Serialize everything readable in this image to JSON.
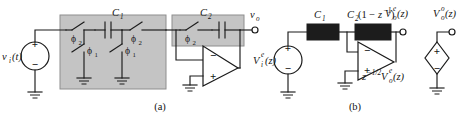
{
  "figure": {
    "background_color": "#ffffff",
    "wire_color": "#1a1a1a",
    "shade_color": "#c4c4c4",
    "cap_block_color": "#1c1c1c"
  },
  "captions": {
    "a": "(a)",
    "b": "(b)"
  },
  "panel_a": {
    "source": {
      "name": "input-source",
      "label_main": "v",
      "label_sub": "i",
      "label_tail": "(t)",
      "plus": "+",
      "minus": "−"
    },
    "switches": [
      {
        "id": "sw-series-1",
        "phase": "ϕ",
        "phase_sub": "2"
      },
      {
        "id": "sw-shunt-1",
        "phase": "ϕ",
        "phase_sub": "1"
      },
      {
        "id": "sw-shunt-2",
        "phase": "ϕ",
        "phase_sub": "1"
      },
      {
        "id": "sw-series-2",
        "phase": "ϕ",
        "phase_sub": "2"
      },
      {
        "id": "sw-series-3",
        "phase": "ϕ",
        "phase_sub": "2"
      }
    ],
    "capacitors": [
      {
        "id": "cap-c1",
        "label": "C",
        "label_sub": "1"
      },
      {
        "id": "cap-c2",
        "label": "C",
        "label_sub": "2"
      }
    ],
    "opamp": {
      "minus": "−",
      "plus": "+"
    },
    "output": {
      "label_main": "v",
      "label_sub": "o"
    }
  },
  "panel_b": {
    "source": {
      "name": "input-source-z",
      "label_main": "V",
      "label_sub": "i",
      "label_sup": "e",
      "label_tail": "(z)",
      "plus": "+",
      "minus": "−"
    },
    "impedances": [
      {
        "id": "block-c1",
        "label": "C",
        "label_sub": "1",
        "label_tail": ""
      },
      {
        "id": "block-c2",
        "label": "C",
        "label_sub": "2",
        "label_tail": "(1 − z−1)"
      }
    ],
    "c2_expression": {
      "base": "C",
      "sub": "2",
      "open": "(1 − ",
      "z": "z",
      "exp": "−1",
      "close": ")"
    },
    "opamp": {
      "minus": "−",
      "plus": "+"
    },
    "opamp_output_label": {
      "prefix": "z",
      "exp": "−1/2",
      "v": "V",
      "sub": "o",
      "sup": "e",
      "tail": "(z)"
    },
    "outputs": [
      {
        "id": "node-vo-even",
        "label_main": "V",
        "label_sub": "o",
        "label_sup": "e",
        "label_tail": "(z)"
      },
      {
        "id": "node-vo-odd",
        "label_main": "V",
        "label_sub": "o",
        "label_sup": "o",
        "label_tail": "(z)"
      }
    ],
    "dependent_source": {
      "name": "dependent-source",
      "plus": "+",
      "minus": "−"
    }
  }
}
